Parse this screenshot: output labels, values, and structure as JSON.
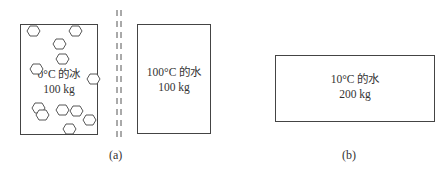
{
  "panel_a": {
    "ice_box": {
      "line1": "0°C 的冰",
      "line2": "100 kg"
    },
    "water_box": {
      "line1": "100°C 的水",
      "line2": "100 kg"
    },
    "caption": "(a)"
  },
  "panel_b": {
    "water_box": {
      "line1": "10°C 的水",
      "line2": "200 kg"
    },
    "caption": "(b)"
  }
}
